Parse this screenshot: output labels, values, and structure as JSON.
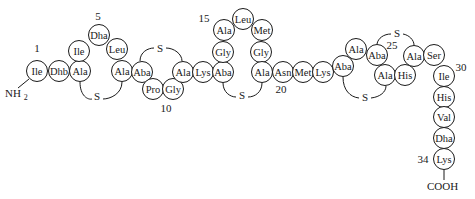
{
  "diagram": {
    "title": "",
    "terminal_n": "NH2",
    "terminal_c": "COOH",
    "position_labels": [
      {
        "text": "1",
        "x": 37,
        "y": 52
      },
      {
        "text": "5",
        "x": 98,
        "y": 20
      },
      {
        "text": "10",
        "x": 166,
        "y": 112
      },
      {
        "text": "15",
        "x": 204,
        "y": 22
      },
      {
        "text": "20",
        "x": 281,
        "y": 93
      },
      {
        "text": "25",
        "x": 392,
        "y": 49
      },
      {
        "text": "30",
        "x": 461,
        "y": 71
      },
      {
        "text": "34",
        "x": 423,
        "y": 163
      }
    ],
    "residues": [
      {
        "n": 1,
        "name": "Ile",
        "x": 37,
        "y": 71
      },
      {
        "n": 2,
        "name": "Dhb",
        "x": 59,
        "y": 71
      },
      {
        "n": 3,
        "name": "Ala",
        "x": 80,
        "y": 71
      },
      {
        "n": 4,
        "name": "Ile",
        "x": 79,
        "y": 51
      },
      {
        "n": 5,
        "name": "Dha",
        "x": 99,
        "y": 35
      },
      {
        "n": 6,
        "name": "Leu",
        "x": 117,
        "y": 49
      },
      {
        "n": 7,
        "name": "Ala",
        "x": 122,
        "y": 71
      },
      {
        "n": 8,
        "name": "Aba",
        "x": 142,
        "y": 72
      },
      {
        "n": 9,
        "name": "Pro",
        "x": 153,
        "y": 89
      },
      {
        "n": 10,
        "name": "Gly",
        "x": 173,
        "y": 89
      },
      {
        "n": 11,
        "name": "Ala",
        "x": 183,
        "y": 72
      },
      {
        "n": 12,
        "name": "Lys",
        "x": 203,
        "y": 72
      },
      {
        "n": 13,
        "name": "Aba",
        "x": 223,
        "y": 72
      },
      {
        "n": 14,
        "name": "Gly",
        "x": 223,
        "y": 52
      },
      {
        "n": 15,
        "name": "Ala",
        "x": 224,
        "y": 30
      },
      {
        "n": 16,
        "name": "Leu",
        "x": 243,
        "y": 19
      },
      {
        "n": 17,
        "name": "Met",
        "x": 262,
        "y": 30
      },
      {
        "n": 18,
        "name": "Gly",
        "x": 261,
        "y": 52
      },
      {
        "n": 19,
        "name": "Ala",
        "x": 262,
        "y": 72
      },
      {
        "n": 20,
        "name": "Asn",
        "x": 283,
        "y": 72
      },
      {
        "n": 21,
        "name": "Met",
        "x": 303,
        "y": 72
      },
      {
        "n": 22,
        "name": "Lys",
        "x": 323,
        "y": 72
      },
      {
        "n": 23,
        "name": "Aba",
        "x": 343,
        "y": 66
      },
      {
        "n": 24,
        "name": "Ala",
        "x": 356,
        "y": 49
      },
      {
        "n": 25,
        "name": "Aba",
        "x": 377,
        "y": 55
      },
      {
        "n": 26,
        "name": "Ala",
        "x": 385,
        "y": 75
      },
      {
        "n": 27,
        "name": "His",
        "x": 405,
        "y": 75
      },
      {
        "n": 28,
        "name": "Ala",
        "x": 414,
        "y": 56
      },
      {
        "n": 29,
        "name": "Ser",
        "x": 434,
        "y": 55
      },
      {
        "n": 30,
        "name": "Ile",
        "x": 444,
        "y": 76
      },
      {
        "n": 31,
        "name": "His",
        "x": 444,
        "y": 97
      },
      {
        "n": 32,
        "name": "Val",
        "x": 444,
        "y": 117
      },
      {
        "n": 33,
        "name": "Dha",
        "x": 444,
        "y": 138
      },
      {
        "n": 34,
        "name": "Lys",
        "x": 444,
        "y": 159
      }
    ],
    "sulfur_bridges": [
      {
        "label": "S",
        "from": 3,
        "to": 7,
        "x": 97,
        "y": 100,
        "d": "M 80 82 C 80 96, 88 100, 92 99 M 103 99 C 110 99, 122 94, 122 82"
      },
      {
        "label": "S",
        "from": 8,
        "to": 11,
        "x": 160,
        "y": 52,
        "d": "M 140 61 C 140 52, 148 48, 154 48 M 166 48 C 174 48, 182 54, 182 61"
      },
      {
        "label": "S",
        "from": 13,
        "to": 19,
        "x": 242,
        "y": 99,
        "d": "M 223 83 C 223 92, 230 97, 236 97 M 248 97 C 255 97, 262 92, 262 83"
      },
      {
        "label": "S",
        "from": 23,
        "to": 26,
        "x": 365,
        "y": 101,
        "d": "M 343 77 C 343 90, 350 97, 359 98 M 371 98 C 380 97, 386 92, 386 86"
      },
      {
        "label": "S",
        "from": 25,
        "to": 28,
        "x": 397,
        "y": 37,
        "d": "M 377 44 C 378 38, 384 34, 391 34 M 403 34 C 409 35, 414 40, 414 45"
      }
    ]
  }
}
